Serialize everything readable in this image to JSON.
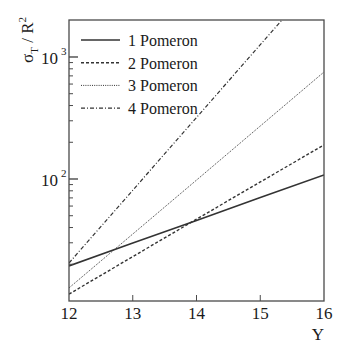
{
  "chart_data": {
    "type": "line",
    "title": "",
    "xlabel": "Y",
    "ylabel": "σT / R²",
    "ylabel_parts": {
      "main": "σ",
      "sub": "T",
      "mid": " / R",
      "sup": "2"
    },
    "xscale": "linear",
    "yscale": "log",
    "xlim": [
      12,
      16
    ],
    "ylim": [
      10,
      2010
    ],
    "grid": false,
    "legend_position": "upper left",
    "xticks": [
      12,
      13,
      14,
      15,
      16
    ],
    "xtick_labels": [
      "12",
      "13",
      "14",
      "15",
      "16"
    ],
    "yticks_major": [
      100,
      1000
    ],
    "ytick_labels": [
      {
        "base": "10",
        "exp": "2",
        "value": 100
      },
      {
        "base": "10",
        "exp": "3",
        "value": 1000
      }
    ],
    "x": [
      12,
      13,
      14,
      15,
      16
    ],
    "series": [
      {
        "name": "1 Pomeron",
        "style": "solid",
        "values": [
          19.4,
          29.8,
          45.8,
          70.4,
          108
        ]
      },
      {
        "name": "2 Pomeron",
        "style": "dashed",
        "values": [
          11.4,
          23.1,
          46.8,
          94.7,
          190
        ]
      },
      {
        "name": "3 Pomeron",
        "style": "dotted",
        "values": [
          12.8,
          35.4,
          98.0,
          272,
          753
        ]
      },
      {
        "name": "4 Pomeron",
        "style": "dashdot",
        "values": [
          20.5,
          81.0,
          319,
          1260,
          4970
        ]
      }
    ]
  },
  "legend": {
    "items": [
      {
        "label": "1 Pomeron"
      },
      {
        "label": "2 Pomeron"
      },
      {
        "label": "3 Pomeron"
      },
      {
        "label": "4 Pomeron"
      }
    ]
  },
  "colors": {
    "axis": "#4a4a4a",
    "line": "#333333",
    "text": "#1a1a1a",
    "background": "#ffffff"
  }
}
